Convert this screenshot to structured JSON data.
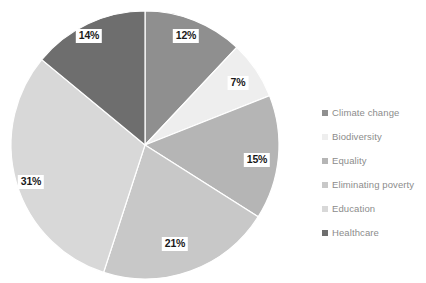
{
  "chart_data": {
    "type": "pie",
    "title": "",
    "categories": [
      "Climate change",
      "Biodiversity",
      "Equality",
      "Eliminating poverty",
      "Education",
      "Healthcare"
    ],
    "values": [
      12,
      7,
      15,
      21,
      31,
      14
    ],
    "value_unit": "%",
    "data_labels": [
      "12%",
      "7%",
      "15%",
      "21%",
      "31%",
      "14%"
    ],
    "colors": [
      "#8f8f8f",
      "#eeeeee",
      "#b5b5b5",
      "#c8c8c8",
      "#d8d8d8",
      "#6e6e6e"
    ],
    "legend_position": "right",
    "start_angle_deg": 0,
    "direction": "clockwise",
    "slice_separator_color": "#ffffff",
    "label_text_color": "#1a1a1a",
    "label_background_color": "#ffffff",
    "legend_text_color": "#8c8c8c",
    "background_color": "#ffffff"
  },
  "legend": {
    "items": [
      {
        "label": "Climate change",
        "color": "#8f8f8f"
      },
      {
        "label": "Biodiversity",
        "color": "#eeeeee"
      },
      {
        "label": "Equality",
        "color": "#b5b5b5"
      },
      {
        "label": "Eliminating poverty",
        "color": "#c8c8c8"
      },
      {
        "label": "Education",
        "color": "#d8d8d8"
      },
      {
        "label": "Healthcare",
        "color": "#6e6e6e"
      }
    ]
  },
  "slice_labels": [
    {
      "text": "12%",
      "x": 186,
      "y": 36
    },
    {
      "text": "7%",
      "x": 238,
      "y": 83
    },
    {
      "text": "15%",
      "x": 257,
      "y": 160
    },
    {
      "text": "21%",
      "x": 175,
      "y": 244
    },
    {
      "text": "31%",
      "x": 31,
      "y": 182
    },
    {
      "text": "14%",
      "x": 89,
      "y": 36
    }
  ]
}
